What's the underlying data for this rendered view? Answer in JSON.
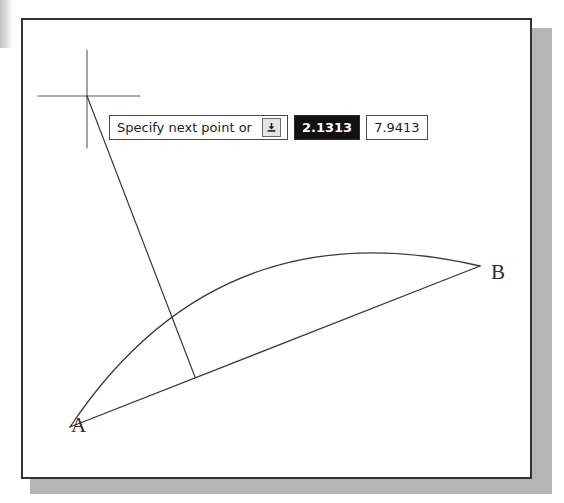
{
  "window": {
    "name": "cad-drawing-area"
  },
  "drawing": {
    "labels": {
      "point_a": "A",
      "point_b": "B"
    },
    "geometry": {
      "point_a": {
        "x": 68,
        "y": 425
      },
      "point_b": {
        "x": 478,
        "y": 264
      },
      "arc_peak": {
        "x": 350,
        "y": 239
      },
      "crosshair": {
        "x": 85,
        "y": 92
      },
      "rubber_band_end": {
        "x": 193,
        "y": 375
      }
    }
  },
  "dynamic_input": {
    "prompt": "Specify next point or",
    "expand_icon": "down-arrow-into-tray-icon",
    "fields": [
      {
        "name": "x-coordinate",
        "value": "2.1313",
        "selected": true
      },
      {
        "name": "y-coordinate",
        "value": "7.9413",
        "selected": false
      }
    ]
  }
}
